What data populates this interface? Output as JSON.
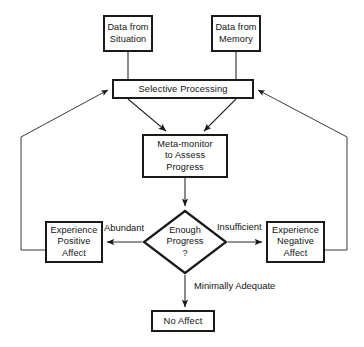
{
  "diagram": {
    "type": "flowchart",
    "colors": {
      "stroke": "#1a1a1a",
      "text": "#141414",
      "background": "#ffffff",
      "thin_stroke": "#3a3a3a"
    },
    "nodes": {
      "data_situation": {
        "shape": "rectangle",
        "line1": "Data from",
        "line2": "Situation"
      },
      "data_memory": {
        "shape": "rectangle",
        "line1": "Data from",
        "line2": "Memory"
      },
      "selective_processing": {
        "shape": "rectangle",
        "line1": "Selective Processing"
      },
      "meta_monitor": {
        "shape": "rectangle",
        "line1": "Meta-monitor",
        "line2": "to Assess",
        "line3": "Progress"
      },
      "decision": {
        "shape": "diamond",
        "line1": "Enough",
        "line2": "Progress",
        "line3": "?"
      },
      "positive_affect": {
        "shape": "rectangle",
        "line1": "Experience",
        "line2": "Positive",
        "line3": "Affect"
      },
      "negative_affect": {
        "shape": "rectangle",
        "line1": "Experience",
        "line2": "Negative",
        "line3": "Affect"
      },
      "no_affect": {
        "shape": "rectangle",
        "line1": "No Affect"
      }
    },
    "edge_labels": {
      "abundant": "Abundant",
      "insufficient": "Insufficient",
      "minimally_adequate": "Minimally Adequate"
    }
  }
}
